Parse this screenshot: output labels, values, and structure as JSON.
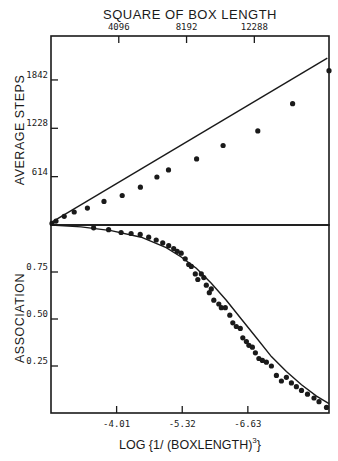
{
  "chart_data": [
    {
      "type": "scatter",
      "panel": "upper",
      "title": "SQUARE OF BOX LENGTH",
      "xlabel": "SQUARE OF BOX LENGTH",
      "ylabel": "AVERAGE STEPS",
      "x_ticks": [
        "4096",
        "8192",
        "12288"
      ],
      "x_tick_values": [
        4096,
        8192,
        12288
      ],
      "y_ticks": [
        "614",
        "1228",
        "1842"
      ],
      "y_tick_values": [
        614,
        1228,
        1842
      ],
      "xlim": [
        0,
        16800
      ],
      "ylim": [
        0,
        2400
      ],
      "grid": false,
      "series": [
        {
          "name": "measured",
          "style": "points",
          "x": [
            60,
            300,
            800,
            1400,
            2200,
            3200,
            4300,
            5400,
            6400,
            7100,
            8800,
            10400,
            12500,
            14600,
            16800
          ],
          "y": [
            20,
            50,
            110,
            165,
            215,
            300,
            375,
            480,
            610,
            700,
            840,
            1010,
            1195,
            1540,
            1960
          ]
        },
        {
          "name": "linear fit",
          "style": "line",
          "x": [
            0,
            16700
          ],
          "y": [
            30,
            2120
          ]
        }
      ]
    },
    {
      "type": "scatter",
      "panel": "lower",
      "xlabel": "LOG (1/ (BOXLENGTH)^3)",
      "ylabel": "ASSOCIATION",
      "x_ticks": [
        "-4.01",
        "-5.32",
        "-6.63"
      ],
      "x_tick_values": [
        -4.01,
        -5.32,
        -6.63
      ],
      "y_ticks": [
        "0.25",
        "0.50",
        "0.75"
      ],
      "y_tick_values": [
        0.25,
        0.5,
        0.75
      ],
      "xlim": [
        -2.7,
        -8.25
      ],
      "ylim": [
        0.0,
        1.0
      ],
      "grid": false,
      "series": [
        {
          "name": "measured",
          "style": "points",
          "x": [
            -3.55,
            -3.85,
            -4.1,
            -4.3,
            -4.48,
            -4.65,
            -4.8,
            -4.93,
            -5.05,
            -5.15,
            -5.22,
            -5.3,
            -5.38,
            -5.45,
            -5.5,
            -5.58,
            -5.63,
            -5.7,
            -5.75,
            -5.8,
            -5.86,
            -5.9,
            -5.95,
            -6.05,
            -6.1,
            -6.18,
            -6.27,
            -6.33,
            -6.4,
            -6.48,
            -6.53,
            -6.6,
            -6.65,
            -6.72,
            -6.78,
            -6.85,
            -6.92,
            -7.0,
            -7.1,
            -7.2,
            -7.3,
            -7.4,
            -7.5,
            -7.6,
            -7.7,
            -7.82,
            -7.95,
            -8.05,
            -8.2
          ],
          "y": [
            0.985,
            0.975,
            0.96,
            0.955,
            0.95,
            0.935,
            0.92,
            0.905,
            0.89,
            0.875,
            0.86,
            0.85,
            0.82,
            0.79,
            0.78,
            0.74,
            0.71,
            0.74,
            0.72,
            0.68,
            0.64,
            0.66,
            0.6,
            0.58,
            0.56,
            0.56,
            0.52,
            0.48,
            0.46,
            0.45,
            0.4,
            0.38,
            0.36,
            0.35,
            0.32,
            0.29,
            0.28,
            0.27,
            0.25,
            0.2,
            0.17,
            0.19,
            0.16,
            0.14,
            0.12,
            0.1,
            0.08,
            0.06,
            0.03
          ],
          "note": "approximate readings from plot"
        },
        {
          "name": "fitted curve",
          "style": "line",
          "x": [
            -2.7,
            -3.3,
            -3.9,
            -4.5,
            -5.0,
            -5.3,
            -5.6,
            -5.9,
            -6.2,
            -6.5,
            -6.8,
            -7.1,
            -7.4,
            -7.7,
            -8.0,
            -8.25
          ],
          "y": [
            1.0,
            0.99,
            0.97,
            0.935,
            0.88,
            0.83,
            0.77,
            0.69,
            0.6,
            0.5,
            0.4,
            0.3,
            0.22,
            0.15,
            0.09,
            0.05
          ]
        }
      ]
    }
  ],
  "labels": {
    "top_axis_title": "SQUARE OF BOX LENGTH",
    "upper_ylabel": "AVERAGE STEPS",
    "lower_ylabel": "ASSOCIATION",
    "bottom_axis_title_main": "LOG {1/ (BOXLENGTH)",
    "bottom_axis_title_sup": "3",
    "bottom_axis_title_end": "}"
  },
  "colors": {
    "ink": "#1a1a1a",
    "background": "#ffffff"
  }
}
